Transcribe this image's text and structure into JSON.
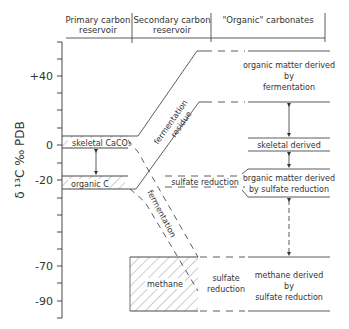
{
  "headers": {
    "primary": [
      "Primary carbon",
      "reservoir"
    ],
    "secondary": [
      "Secondary carbon",
      "reservoir"
    ],
    "organic": "\"Organic\" carbonates"
  },
  "y_axis": {
    "label": "δ ¹³C ‰ PDB",
    "ticks": [
      "+40",
      "0",
      "-20",
      "-70",
      "-90"
    ]
  },
  "primary": {
    "skeletal": "skeletal CaCO₃",
    "organic": "organic C"
  },
  "secondary": {
    "fermentation_residue": [
      "fermentation",
      "residue"
    ],
    "fermentation": "fermentation",
    "sulfate_reduction_mid": "sulfate reduction",
    "methane": "methane",
    "sulfate_reduction_low": [
      "sulfate",
      "reduction"
    ]
  },
  "organic_carbonates": {
    "fermentation": [
      "organic matter derived",
      "by",
      "fermentation"
    ],
    "skeletal": "skeletal derived",
    "sulfate": [
      "organic matter derived",
      "by sulfate reduction"
    ],
    "methane": [
      "methane derived",
      "by",
      "sulfate reduction"
    ]
  },
  "colors": {
    "ink": "#333333",
    "background": "#ffffff"
  }
}
